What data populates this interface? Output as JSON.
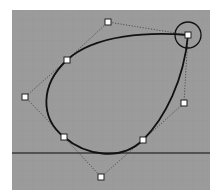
{
  "viewport": {
    "label": "Curve editor viewport",
    "background": "#9b9b9b",
    "grid_color": "#939393",
    "grid_spacing": 10,
    "bounds": {
      "x": 12,
      "y": 10,
      "width": 198,
      "height": 180
    }
  },
  "baseline": {
    "y": 153,
    "color": "#3a3a3a"
  },
  "curve": {
    "color": "#111111",
    "closed": true,
    "hull_color": "#3c3c3c",
    "control_vertices": [
      {
        "id": "cv-top",
        "x": 108,
        "y": 22,
        "on_curve": false
      },
      {
        "id": "knot-upper-left",
        "x": 67,
        "y": 60,
        "on_curve": true
      },
      {
        "id": "cv-left",
        "x": 25,
        "y": 97,
        "on_curve": false
      },
      {
        "id": "knot-lower-left",
        "x": 64,
        "y": 137,
        "on_curve": true
      },
      {
        "id": "cv-bottom",
        "x": 101,
        "y": 177,
        "on_curve": false
      },
      {
        "id": "knot-lower-right",
        "x": 143,
        "y": 140,
        "on_curve": true
      },
      {
        "id": "cv-right",
        "x": 184,
        "y": 103,
        "on_curve": false
      },
      {
        "id": "knot-top-right",
        "x": 188,
        "y": 35,
        "on_curve": true,
        "selected": true
      }
    ]
  },
  "selection": {
    "target": "knot-top-right",
    "x": 188,
    "y": 35,
    "radius": 13
  }
}
